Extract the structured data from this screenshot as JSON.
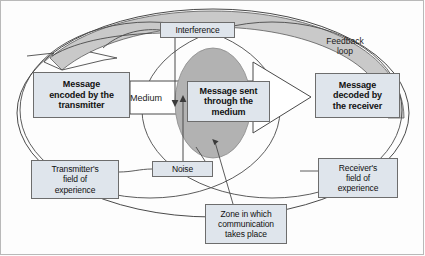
{
  "diagram": {
    "colors": {
      "box_fill": "#dfe5ec",
      "box_stroke": "#6d6d6d",
      "ellipse_fill": "#b2b2b2",
      "feedback_band_fill": "#c9c9c9",
      "line": "#4a4a4a",
      "frame": "#b9b9b9"
    },
    "nodes": {
      "transmitter": {
        "label": "Message\nencoded by the\ntransmitter",
        "name": "message-encoded-by-transmitter"
      },
      "medium_message": {
        "label": "Message sent\nthrough the\nmedium",
        "name": "message-sent-through-medium"
      },
      "receiver": {
        "label": "Message\ndecoded by\nthe receiver",
        "name": "message-decoded-by-receiver"
      },
      "interference": {
        "label": "Interference",
        "name": "interference"
      },
      "noise": {
        "label": "Noise",
        "name": "noise"
      },
      "transmitter_field": {
        "label": "Transmitter's\nfield of\nexperience",
        "name": "transmitters-field-of-experience"
      },
      "receiver_field": {
        "label": "Receiver's\nfield of\nexperience",
        "name": "receivers-field-of-experience"
      },
      "zone": {
        "label": "Zone in which\ncommunication\ntakes place",
        "name": "zone-in-which-communication-takes-place"
      }
    },
    "labels": {
      "medium": "Medium",
      "feedback_loop": "Feedback\nloop"
    }
  }
}
